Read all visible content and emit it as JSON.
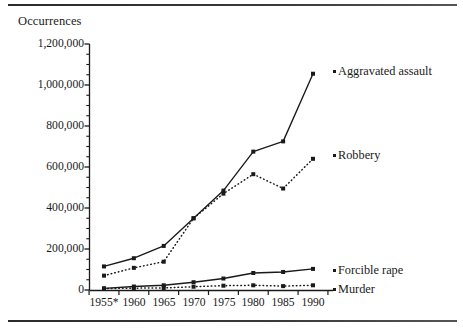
{
  "figure": {
    "y_axis_title": "Occurrences",
    "top_rule": "horizontal-rule",
    "bottom_rule": "horizontal-rule"
  },
  "chart_data": {
    "type": "line",
    "title": "",
    "subtitle": "",
    "xlabel": "",
    "ylabel": "Occurrences",
    "x": [
      1955,
      1960,
      1965,
      1970,
      1975,
      1980,
      1985,
      1990
    ],
    "categories": [
      "1955*",
      "1960",
      "1965",
      "1970",
      "1975",
      "1980",
      "1985",
      "1990"
    ],
    "xlim": [
      1955,
      1990
    ],
    "ylim": [
      0,
      1200000
    ],
    "ytick_values": [
      0,
      200000,
      400000,
      600000,
      800000,
      1000000,
      1200000
    ],
    "ytick_labels": [
      "0",
      "200,000",
      "400,000",
      "600,000",
      "800,000",
      "1,000,000",
      "1,200,000"
    ],
    "yminor_step": 50000,
    "grid": false,
    "legend": "inline-right-of-series-endpoints",
    "series": [
      {
        "name": "Aggravated assault",
        "label": "Aggravated assault",
        "style": "solid",
        "marker": "square",
        "color": "#1a1a1a",
        "values": [
          115000,
          155000,
          215000,
          350000,
          485000,
          675000,
          725000,
          1055000
        ]
      },
      {
        "name": "Robbery",
        "label": "Robbery",
        "style": "dotted",
        "marker": "square",
        "color": "#1a1a1a",
        "values": [
          70000,
          108000,
          138000,
          350000,
          470000,
          565000,
          495000,
          640000
        ]
      },
      {
        "name": "Forcible rape",
        "label": "Forcible rape",
        "style": "solid",
        "marker": "square",
        "color": "#1a1a1a",
        "values": [
          8000,
          17000,
          23000,
          38000,
          56000,
          83000,
          88000,
          103000
        ]
      },
      {
        "name": "Murder",
        "label": "Murder",
        "style": "dotted",
        "marker": "square",
        "color": "#1a1a1a",
        "values": [
          7000,
          9000,
          10000,
          16000,
          21000,
          23000,
          19000,
          23000
        ]
      }
    ],
    "annotations": [
      {
        "text": "*",
        "note": "asterisk appended to 1955 category label"
      }
    ]
  },
  "ytick_layout": [
    {
      "label": "1,200,000",
      "top": 38
    },
    {
      "label": "1,000,000",
      "top": 79
    },
    {
      "label": "800,000",
      "top": 120
    },
    {
      "label": "600,000",
      "top": 161
    },
    {
      "label": "400,000",
      "top": 202
    },
    {
      "label": "200,000",
      "top": 243
    },
    {
      "label": "0",
      "top": 284
    }
  ],
  "xtick_layout": [
    {
      "label": "1955*",
      "left": 104
    },
    {
      "label": "1960",
      "left": 134
    },
    {
      "label": "1965",
      "left": 164
    },
    {
      "label": "1970",
      "left": 194
    },
    {
      "label": "1975",
      "left": 224
    },
    {
      "label": "1980",
      "left": 253
    },
    {
      "label": "1985",
      "left": 283
    },
    {
      "label": "1990",
      "left": 313
    }
  ],
  "series_labels": [
    {
      "text": "Aggravated assault",
      "left": 338,
      "top": 65
    },
    {
      "text": "Robbery",
      "left": 338,
      "top": 149
    },
    {
      "text": "Forcible rape",
      "left": 338,
      "top": 264
    },
    {
      "text": "Murder",
      "left": 338,
      "top": 283
    }
  ]
}
